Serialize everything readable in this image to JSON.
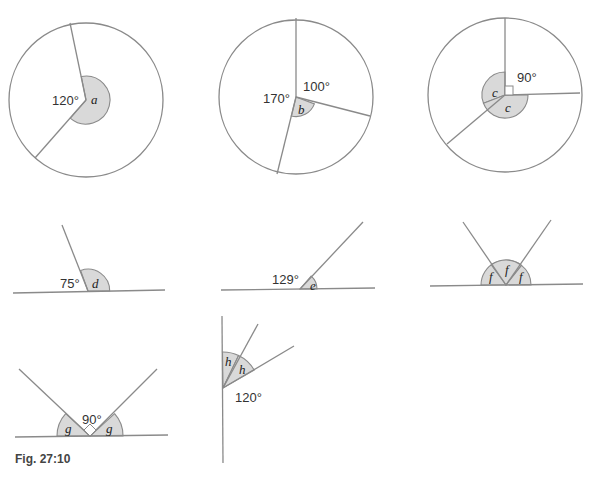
{
  "figure": {
    "caption": "Fig. 27:10",
    "colors": {
      "line": "#8a8a8a",
      "shade": "#d9d9d9",
      "text": "#333333"
    }
  },
  "diagrams": {
    "a": {
      "given_angle": "120°",
      "unknown": "a"
    },
    "b": {
      "given_angle_1": "170°",
      "given_angle_2": "100°",
      "unknown": "b"
    },
    "c": {
      "given_angle": "90°",
      "unknown_1": "c",
      "unknown_2": "c"
    },
    "d": {
      "given_angle": "75°",
      "unknown": "d"
    },
    "e": {
      "given_angle": "129°",
      "unknown": "e"
    },
    "f": {
      "unknown_1": "f",
      "unknown_2": "f",
      "unknown_3": "f"
    },
    "g": {
      "given_angle": "90°",
      "unknown_1": "g",
      "unknown_2": "g"
    },
    "h": {
      "given_angle": "120°",
      "unknown_1": "h",
      "unknown_2": "h"
    }
  }
}
